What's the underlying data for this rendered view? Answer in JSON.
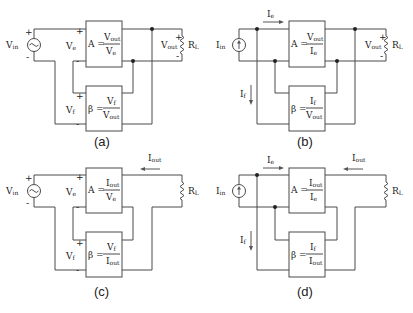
{
  "figure": {
    "panels": [
      {
        "id": "a",
        "caption": "(a)",
        "source": {
          "type": "voltage",
          "label": "Vin",
          "label_main": "V",
          "label_sub": "in",
          "plus": "+",
          "minus": "-"
        },
        "forward_block": {
          "lhs": "A =",
          "num": "Vout",
          "num_main": "V",
          "num_sub": "out",
          "den": "Ve",
          "den_main": "V",
          "den_sub": "e"
        },
        "feedback_block": {
          "lhs": "β =",
          "num": "Vf",
          "num_main": "V",
          "num_sub": "f",
          "den": "Vout",
          "den_main": "V",
          "den_sub": "out"
        },
        "input_port_label": {
          "main": "V",
          "sub": "e",
          "plus": "+",
          "minus": "-"
        },
        "feedback_port_label": {
          "main": "V",
          "sub": "f",
          "plus": "+",
          "minus": "-"
        },
        "output_label": {
          "main": "V",
          "sub": "out",
          "plus": "+",
          "minus": "-"
        },
        "load": {
          "main": "R",
          "sub": "L"
        }
      },
      {
        "id": "b",
        "caption": "(b)",
        "source": {
          "type": "current",
          "label": "Iin",
          "label_main": "I",
          "label_sub": "in"
        },
        "forward_block": {
          "lhs": "A =",
          "num": "Vout",
          "num_main": "V",
          "num_sub": "out",
          "den": "Ie",
          "den_main": "I",
          "den_sub": "e"
        },
        "feedback_block": {
          "lhs": "β =",
          "num": "If",
          "num_main": "I",
          "num_sub": "f",
          "den": "Vout",
          "den_main": "V",
          "den_sub": "out"
        },
        "error_current": {
          "main": "I",
          "sub": "e"
        },
        "feedback_current": {
          "main": "I",
          "sub": "f"
        },
        "output_label": {
          "main": "V",
          "sub": "out",
          "plus": "+",
          "minus": "-"
        },
        "load": {
          "main": "R",
          "sub": "L"
        }
      },
      {
        "id": "c",
        "caption": "(c)",
        "source": {
          "type": "voltage",
          "label": "Vin",
          "label_main": "V",
          "label_sub": "in",
          "plus": "+",
          "minus": "-"
        },
        "forward_block": {
          "lhs": "A =",
          "num": "Iout",
          "num_main": "I",
          "num_sub": "out",
          "den": "Ve",
          "den_main": "V",
          "den_sub": "e"
        },
        "feedback_block": {
          "lhs": "β =",
          "num": "Vf",
          "num_main": "V",
          "num_sub": "f",
          "den": "Iout",
          "den_main": "I",
          "den_sub": "out"
        },
        "input_port_label": {
          "main": "V",
          "sub": "e",
          "plus": "+",
          "minus": "-"
        },
        "feedback_port_label": {
          "main": "V",
          "sub": "f",
          "plus": "+",
          "minus": "-"
        },
        "output_current": {
          "main": "I",
          "sub": "out"
        },
        "load": {
          "main": "R",
          "sub": "L"
        }
      },
      {
        "id": "d",
        "caption": "(d)",
        "source": {
          "type": "current",
          "label": "Iin",
          "label_main": "I",
          "label_sub": "in"
        },
        "forward_block": {
          "lhs": "A =",
          "num": "Iout",
          "num_main": "I",
          "num_sub": "out",
          "den": "Ie",
          "den_main": "I",
          "den_sub": "e"
        },
        "feedback_block": {
          "lhs": "β =",
          "num": "If",
          "num_main": "I",
          "num_sub": "f",
          "den": "Iout",
          "den_main": "I",
          "den_sub": "out"
        },
        "error_current": {
          "main": "I",
          "sub": "e"
        },
        "feedback_current": {
          "main": "I",
          "sub": "f"
        },
        "output_current": {
          "main": "I",
          "sub": "out"
        },
        "load": {
          "main": "R",
          "sub": "L"
        }
      }
    ]
  }
}
